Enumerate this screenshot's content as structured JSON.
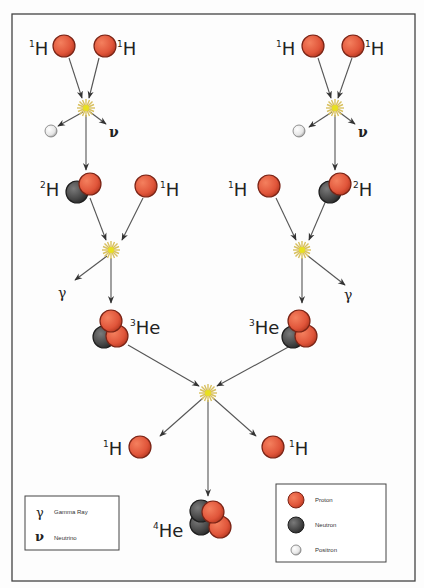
{
  "diagram": {
    "colors": {
      "proton": "#e0553a",
      "proton_edge": "#7a2416",
      "neutron": "#4a4a4a",
      "neutron_edge": "#1e1e1e",
      "positron": "#f2f2f2",
      "positron_edge": "#777777",
      "arrow": "#555555",
      "flash_core": "#e8e020",
      "flash_rays": "#d8c060",
      "frame": "#444444"
    },
    "frame": {
      "x": 12,
      "y": 14,
      "w": 403,
      "h": 567
    },
    "labels": {
      "h1_tl_a": {
        "sup": "1",
        "text": "H"
      },
      "h1_tl_b": {
        "sup": "1",
        "text": "H"
      },
      "h1_tr_a": {
        "sup": "1",
        "text": "H"
      },
      "h1_tr_b": {
        "sup": "1",
        "text": "H"
      },
      "h2_left": {
        "sup": "2",
        "text": "H"
      },
      "h1_left_mid": {
        "sup": "1",
        "text": "H"
      },
      "h1_right_mid": {
        "sup": "1",
        "text": "H"
      },
      "h2_right": {
        "sup": "2",
        "text": "H"
      },
      "he3_left": {
        "sup": "3",
        "text": "He"
      },
      "he3_right": {
        "sup": "3",
        "text": "He"
      },
      "h1_out_left": {
        "sup": "1",
        "text": "H"
      },
      "h1_out_right": {
        "sup": "1",
        "text": "H"
      },
      "he4": {
        "sup": "4",
        "text": "He"
      },
      "nu_left": "ν",
      "nu_right": "ν",
      "gamma_left": "γ",
      "gamma_right": "γ"
    },
    "legend_particles": {
      "items": [
        {
          "type": "proton",
          "label": "Proton"
        },
        {
          "type": "neutron",
          "label": "Neutron"
        },
        {
          "type": "positron",
          "label": "Positron"
        }
      ]
    },
    "legend_symbols": {
      "items": [
        {
          "symbol": "γ",
          "label": "Gamma Ray"
        },
        {
          "symbol": "ν",
          "label": "Neutrino"
        }
      ]
    }
  }
}
